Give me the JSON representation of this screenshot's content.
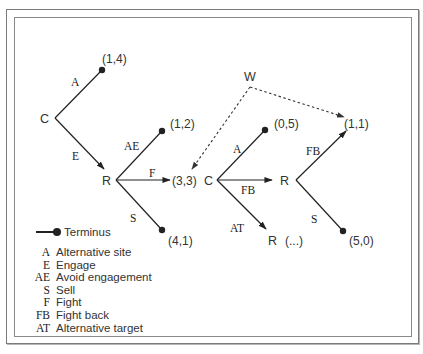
{
  "diagram": {
    "nodes": [
      {
        "id": "C1",
        "label": "C"
      },
      {
        "id": "R1",
        "label": "R"
      },
      {
        "id": "C2",
        "label": "C"
      },
      {
        "id": "R2",
        "label": "R"
      },
      {
        "id": "R3",
        "label": "R"
      },
      {
        "id": "W",
        "label": "W"
      }
    ],
    "payoffs": {
      "c1_a": "(1,4)",
      "r1_ae": "(1,2)",
      "r1_f": "(3,3)",
      "r1_s": "(4,1)",
      "c2_a": "(0,5)",
      "r2_fb": "(1,1)",
      "r2_s": "(5,0)",
      "r3_cont": "(...)"
    },
    "edge_labels": {
      "c1_a": "A",
      "c1_e": "E",
      "r1_ae": "AE",
      "r1_f": "F",
      "r1_s": "S",
      "c2_a": "A",
      "c2_fb": "FB",
      "c2_at": "AT",
      "r2_fb": "FB",
      "r2_s": "S"
    }
  },
  "legend": {
    "terminus_label": "Terminus",
    "items": [
      {
        "abbr": "A",
        "desc": "Alternative site"
      },
      {
        "abbr": "E",
        "desc": "Engage"
      },
      {
        "abbr": "AE",
        "desc": "Avoid engagement"
      },
      {
        "abbr": "S",
        "desc": "Sell"
      },
      {
        "abbr": "F",
        "desc": "Fight"
      },
      {
        "abbr": "FB",
        "desc": "Fight back"
      },
      {
        "abbr": "AT",
        "desc": "Alternative target"
      }
    ]
  },
  "colors": {
    "line": "#222222",
    "text": "#333333",
    "frame": "#7a7a7a"
  }
}
